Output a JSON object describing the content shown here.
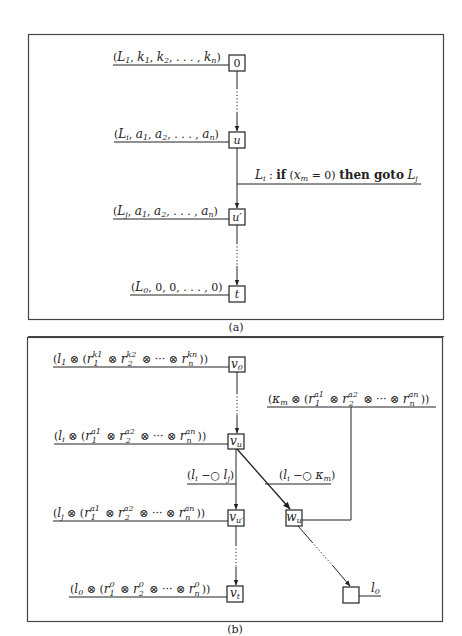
{
  "panel_a": {
    "caption": "(a)",
    "nodes": [
      {
        "id": "0",
        "label": "0"
      },
      {
        "id": "u",
        "label": "u"
      },
      {
        "id": "u_prime",
        "label": "u′"
      },
      {
        "id": "t",
        "label": "t"
      }
    ],
    "state_labels": {
      "initial": {
        "L": "L",
        "Lsub": "1",
        "rest": "k",
        "items": [
          "k1",
          "k2",
          "...",
          "kn"
        ]
      },
      "before": {
        "L": "L",
        "Lsub": "i",
        "items": [
          "a1",
          "a2",
          "...",
          "an"
        ]
      },
      "after": {
        "L": "L",
        "Lsub": "j",
        "items": [
          "a1",
          "a2",
          "...",
          "an"
        ]
      },
      "final": {
        "L": "L",
        "Lsub": "0",
        "items": [
          "0",
          "0",
          "...",
          "0"
        ]
      }
    },
    "instruction": {
      "label_L": "L",
      "label_Lsub": "i",
      "colon": " : ",
      "kw_if": "if",
      "cond_open": " (",
      "cond_var": "x",
      "cond_var_sub": "m",
      "cond_rest": " = 0) ",
      "kw_then_goto": "then goto",
      "target_L": "L",
      "target_sub": "j"
    }
  },
  "panel_b": {
    "caption": "(b)",
    "nodes": [
      {
        "id": "v0",
        "label": "v",
        "sub": "0"
      },
      {
        "id": "vu",
        "label": "v",
        "sub": "u"
      },
      {
        "id": "vu_prime",
        "label": "v",
        "sub": "u′"
      },
      {
        "id": "vt",
        "label": "v",
        "sub": "t"
      },
      {
        "id": "wu",
        "label": "w",
        "sub": "u"
      },
      {
        "id": "sink",
        "label": ""
      }
    ],
    "formulas": {
      "initial": "(l₁ ⊗ (r₁^k₁ ⊗ r₂^k₂ ⊗ ··· ⊗ rₙ^kₙ))",
      "before": "(lᵢ ⊗ (r₁^a₁ ⊗ r₂^a₂ ⊗ ··· ⊗ rₙ^aₙ))",
      "after": "(lⱼ ⊗ (r₁^a₁ ⊗ r₂^a₂ ⊗ ··· ⊗ rₙ^aₙ))",
      "final": "(l₀ ⊗ (r₁⁰ ⊗ r₂⁰ ⊗ ··· ⊗ rₙ⁰))",
      "kappa": "(κₘ ⊗ (r₁^a₁ ⊗ r₂^a₂ ⊗ ··· ⊗ rₙ^aₙ))",
      "axiom_j": "(lᵢ ⊸ lⱼ)",
      "axiom_k": "(lᵢ ⊸ κₘ)",
      "sink_label": "l₀"
    },
    "math": {
      "otimes": "⊗",
      "cdots": "···",
      "lolli": "−○"
    }
  }
}
